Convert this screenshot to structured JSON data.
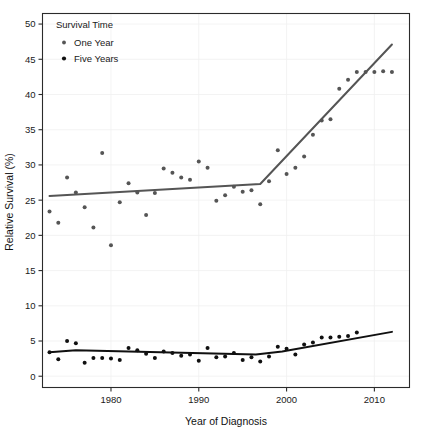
{
  "chart_data": {
    "type": "scatter",
    "title": "",
    "xlabel": "Year of Diagnosis",
    "ylabel": "Relative Survival (%)",
    "xlim": [
      1972.2,
      2014.0
    ],
    "ylim": [
      -1.6,
      51.5
    ],
    "xticks": [
      1980,
      1990,
      2000,
      2010
    ],
    "yticks": [
      0,
      5,
      10,
      15,
      20,
      25,
      30,
      35,
      40,
      45,
      50
    ],
    "xtick_labels": [
      "1980",
      "1990",
      "2000",
      "2010"
    ],
    "ytick_labels": [
      "0",
      "5",
      "10",
      "15",
      "20",
      "25",
      "30",
      "35",
      "40",
      "45",
      "50"
    ],
    "grid": true,
    "legend_position": "top-left",
    "legend": {
      "title": "Survival Time",
      "entries": [
        {
          "name": "One Year",
          "marker": "circle",
          "color": "#555555"
        },
        {
          "name": "Five Years",
          "marker": "circle",
          "color": "#101010"
        }
      ]
    },
    "series": [
      {
        "name": "One Year",
        "marker_color": "#555555",
        "line_color": "#555555",
        "x": [
          1973,
          1974,
          1975,
          1976,
          1977,
          1978,
          1979,
          1980,
          1981,
          1982,
          1983,
          1984,
          1985,
          1986,
          1987,
          1988,
          1989,
          1990,
          1991,
          1992,
          1993,
          1994,
          1995,
          1996,
          1997,
          1998,
          1999,
          2000,
          2001,
          2002,
          2003,
          2004,
          2005,
          2006,
          2007,
          2008,
          2009,
          2010,
          2011,
          2012
        ],
        "y": [
          23.4,
          21.8,
          28.2,
          26.1,
          24.0,
          21.1,
          31.7,
          18.6,
          24.7,
          27.4,
          26.1,
          22.9,
          26.0,
          29.5,
          28.9,
          28.2,
          27.9,
          30.5,
          29.6,
          24.9,
          25.7,
          26.9,
          26.2,
          26.4,
          24.4,
          27.7,
          32.1,
          28.7,
          29.6,
          31.2,
          34.3,
          36.3,
          36.5,
          40.8,
          42.1,
          43.2,
          43.2,
          43.2,
          43.3,
          43.2
        ],
        "trend_line": {
          "type": "joinpoint",
          "nodes": [
            {
              "x": 1973.0,
              "y": 25.6
            },
            {
              "x": 1997.0,
              "y": 27.3
            },
            {
              "x": 2012.0,
              "y": 47.1
            }
          ]
        }
      },
      {
        "name": "Five Years",
        "marker_color": "#101010",
        "line_color": "#101010",
        "x": [
          1973,
          1974,
          1975,
          1976,
          1977,
          1978,
          1979,
          1980,
          1981,
          1982,
          1983,
          1984,
          1985,
          1986,
          1987,
          1988,
          1989,
          1990,
          1991,
          1992,
          1993,
          1994,
          1995,
          1996,
          1997,
          1998,
          1999,
          2000,
          2001,
          2002,
          2003,
          2004,
          2005,
          2006,
          2007,
          2008
        ],
        "y": [
          3.4,
          2.4,
          5.0,
          4.7,
          1.9,
          2.6,
          2.6,
          2.5,
          2.3,
          4.0,
          3.7,
          3.2,
          2.6,
          3.5,
          3.3,
          2.9,
          3.1,
          2.2,
          4.0,
          2.7,
          2.8,
          3.3,
          2.3,
          2.7,
          2.1,
          2.8,
          4.2,
          3.9,
          3.1,
          4.5,
          4.8,
          5.5,
          5.5,
          5.6,
          5.7,
          6.2
        ],
        "trend_line": {
          "type": "joinpoint",
          "nodes": [
            {
              "x": 1973.0,
              "y": 3.4
            },
            {
              "x": 1976.0,
              "y": 3.7
            },
            {
              "x": 1996.5,
              "y": 3.1
            },
            {
              "x": 1999.5,
              "y": 3.5
            },
            {
              "x": 2012.0,
              "y": 6.3
            }
          ]
        }
      }
    ]
  },
  "colors": {
    "frame": "#2b2b2b",
    "grid": "#f0f0f0",
    "background": "#ffffff",
    "series_one_year": "#555555",
    "series_five_years": "#101010"
  }
}
